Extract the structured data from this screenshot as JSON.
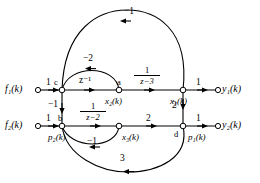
{
  "figure": {
    "type": "signal-flow-graph",
    "width": 260,
    "height": 183,
    "background": "#ffffff",
    "stroke": "#000000"
  },
  "inputs": [
    {
      "id": "f1",
      "label": "f₁(k)",
      "x": 8,
      "y": 90,
      "terminal_x": 38,
      "terminal_y": 90
    },
    {
      "id": "f2",
      "label": "f₂(k)",
      "x": 8,
      "y": 126,
      "terminal_x": 38,
      "terminal_y": 126
    }
  ],
  "outputs": [
    {
      "id": "y1",
      "label": "y₁(k)",
      "x": 222,
      "y": 90,
      "terminal_x": 218,
      "terminal_y": 90
    },
    {
      "id": "y2",
      "label": "y₂(k)",
      "x": 222,
      "y": 126,
      "terminal_x": 218,
      "terminal_y": 126
    }
  ],
  "nodes": [
    {
      "id": "c",
      "tag": "c",
      "x": 62,
      "y": 90,
      "tag_dx": -6,
      "tag_dy": -13
    },
    {
      "id": "a",
      "tag": "a",
      "x": 119,
      "y": 90,
      "tag_dx": -1,
      "tag_dy": -13
    },
    {
      "id": "x1",
      "tag": "",
      "x": 183,
      "y": 90,
      "tag_dx": 0,
      "tag_dy": 0
    },
    {
      "id": "b",
      "tag": "b",
      "x": 62,
      "y": 126,
      "tag_dx": -1,
      "tag_dy": -13
    },
    {
      "id": "x3",
      "tag": "",
      "x": 119,
      "y": 126,
      "tag_dx": 0,
      "tag_dy": 0
    },
    {
      "id": "d",
      "tag": "d",
      "x": 183,
      "y": 126,
      "tag_dx": -9,
      "tag_dy": 12
    }
  ],
  "state_labels": [
    {
      "id": "x2",
      "text": "x₂(k)",
      "x": 104,
      "y": 97
    },
    {
      "id": "x1",
      "text": "x₁(k)",
      "x": 172,
      "y": 97
    },
    {
      "id": "x3",
      "text": "x₃(k)",
      "x": 120,
      "y": 133
    },
    {
      "id": "p2",
      "text": "p₂(k)",
      "x": 50,
      "y": 133
    },
    {
      "id": "p1",
      "text": "p₁(k)",
      "x": 186,
      "y": 133
    }
  ],
  "edges": [
    {
      "id": "f1-to-c",
      "from": "f1",
      "to": "c",
      "gain": "1",
      "gain_x": 48,
      "gain_y": 81,
      "shape": "straight",
      "direction": "right"
    },
    {
      "id": "c-to-a",
      "from": "c",
      "to": "a",
      "gain": "z⁻¹",
      "gain_x": 82,
      "gain_y": 80,
      "shape": "straight",
      "direction": "right"
    },
    {
      "id": "a-to-x1",
      "from": "a",
      "to": "x1",
      "gain": "1/(z−3)",
      "gain_kind": "fraction",
      "numerator": "1",
      "denominator": "z−3",
      "gain_x": 144,
      "gain_y": 72,
      "shape": "straight",
      "direction": "right"
    },
    {
      "id": "x1-to-y1",
      "from": "x1",
      "to": "y1",
      "gain": "1",
      "gain_x": 198,
      "gain_y": 81,
      "shape": "straight",
      "direction": "right"
    },
    {
      "id": "f2-to-b",
      "from": "f2",
      "to": "b",
      "gain": "1",
      "gain_x": 48,
      "gain_y": 117,
      "shape": "straight",
      "direction": "right"
    },
    {
      "id": "b-to-x3",
      "from": "b",
      "to": "x3",
      "gain": "1/(z−2)",
      "gain_kind": "fraction",
      "numerator": "1",
      "denominator": "z−2",
      "gain_x": 88,
      "gain_y": 108,
      "shape": "straight",
      "direction": "right"
    },
    {
      "id": "x3-to-d",
      "from": "x3",
      "to": "d",
      "gain": "2",
      "gain_x": 148,
      "gain_y": 117,
      "shape": "straight",
      "direction": "right"
    },
    {
      "id": "d-to-y2",
      "from": "d",
      "to": "y2",
      "gain": "1",
      "gain_x": 198,
      "gain_y": 117,
      "shape": "straight",
      "direction": "right"
    },
    {
      "id": "c-to-b",
      "from": "c",
      "to": "b",
      "gain": "−1",
      "gain_x": 51,
      "gain_y": 104,
      "shape": "vertical",
      "direction": "down"
    },
    {
      "id": "x1-to-d",
      "from": "x1",
      "to": "d",
      "gain": "2",
      "gain_x": 173,
      "gain_y": 104,
      "shape": "vertical",
      "direction": "down"
    },
    {
      "id": "a-to-c",
      "from": "a",
      "to": "c",
      "gain": "−2",
      "gain_x": 84,
      "gain_y": 58,
      "shape": "arc-over",
      "direction": "left"
    },
    {
      "id": "x1-to-c",
      "from": "x1",
      "to": "c",
      "gain": "−1",
      "gain_x": 127,
      "gain_y": 11,
      "shape": "arc-over-wide",
      "direction": "left"
    },
    {
      "id": "x3-to-b",
      "from": "x3",
      "to": "b",
      "gain": "−1",
      "gain_x": 89,
      "gain_y": 140,
      "shape": "arc-under",
      "direction": "left"
    },
    {
      "id": "d-to-b",
      "from": "d",
      "to": "b",
      "gain": "3",
      "gain_x": 122,
      "gain_y": 157,
      "shape": "arc-under-wide",
      "direction": "left"
    }
  ]
}
